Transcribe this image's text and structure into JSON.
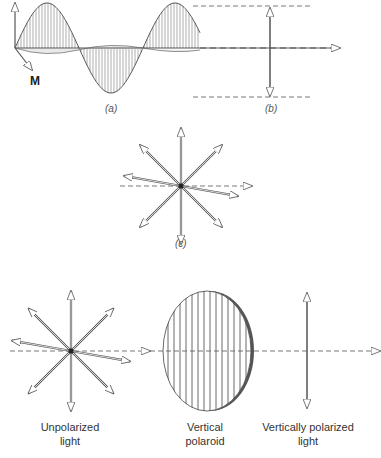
{
  "figure": {
    "panel_a": {
      "caption": "(a)",
      "axis_label": "M"
    },
    "panel_b": {
      "caption": "(b)"
    },
    "panel_c": {
      "caption": "(c)"
    },
    "bottom": {
      "unpolarized_label_line1": "Unpolarized",
      "unpolarized_label_line2": "light",
      "polaroid_label_line1": "Vertical",
      "polaroid_label_line2": "polaroid",
      "polarized_label_line1": "Vertically polarized",
      "polarized_label_line2": "light"
    }
  },
  "colors": {
    "line": "#555555",
    "hatch": "#777777",
    "dark_edge": "#444444"
  }
}
